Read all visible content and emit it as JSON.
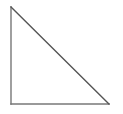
{
  "canvas": {
    "width": 123,
    "height": 114,
    "background_color": "#ffffff"
  },
  "figure": {
    "name": "right-triangle",
    "stroke_color": "#777777",
    "hypotenuse_stroke_color": "#555555",
    "stroke_width": 1.4,
    "fill": "none",
    "right_angle_vertex": "bottom-left",
    "vertices": [
      {
        "label": "top-left",
        "x": 11,
        "y": 7
      },
      {
        "label": "bottom-left",
        "x": 11,
        "y": 104
      },
      {
        "label": "bottom-right",
        "x": 109,
        "y": 104
      }
    ],
    "edges": [
      {
        "name": "vertical-leg",
        "from": "top-left",
        "to": "bottom-left",
        "x1": 11,
        "y1": 7,
        "x2": 11,
        "y2": 104,
        "color": "#777777"
      },
      {
        "name": "horizontal-leg",
        "from": "bottom-left",
        "to": "bottom-right",
        "x1": 11,
        "y1": 104,
        "x2": 109,
        "y2": 104,
        "color": "#777777"
      },
      {
        "name": "hypotenuse",
        "from": "top-left",
        "to": "bottom-right",
        "x1": 11,
        "y1": 7,
        "x2": 109,
        "y2": 104,
        "color": "#555555"
      }
    ],
    "labels": []
  }
}
